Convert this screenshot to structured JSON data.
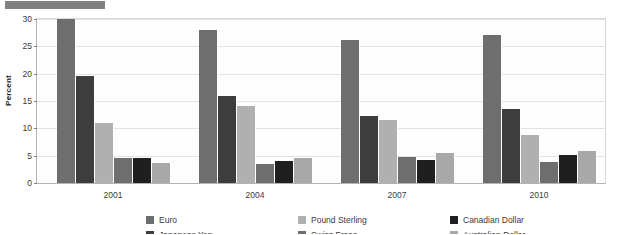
{
  "top_bar": {
    "name": "header-marker-bar",
    "color": "#808080"
  },
  "chart_data": {
    "type": "bar",
    "title": "",
    "subtitle": "",
    "xlabel": "",
    "ylabel": "Percent",
    "ylim": [
      0,
      30
    ],
    "yticks": [
      0,
      5,
      10,
      15,
      20,
      25,
      30
    ],
    "ytick_labels": [
      "0",
      "5",
      "10",
      "15",
      "20",
      "25",
      "30"
    ],
    "grid": true,
    "legend_position": "bottom",
    "categories": [
      "2001",
      "2004",
      "2007",
      "2010"
    ],
    "series": [
      {
        "name": "Euro",
        "color": "#6e6e6e",
        "values": [
          30.0,
          27.9,
          26.2,
          27.1
        ]
      },
      {
        "name": "Japanese Yen",
        "color": "#3d3d3d",
        "values": [
          19.5,
          15.9,
          12.2,
          13.5
        ]
      },
      {
        "name": "Pound Sterling",
        "color": "#b0b0b0",
        "values": [
          11.0,
          14.0,
          11.5,
          8.8
        ]
      },
      {
        "name": "Swiss Franc",
        "color": "#6e6e6e",
        "values": [
          4.6,
          3.5,
          4.7,
          3.9
        ]
      },
      {
        "name": "Canadian Dollar",
        "color": "#1f1f1f",
        "values": [
          4.5,
          4.1,
          4.3,
          5.2
        ]
      },
      {
        "name": "Australian Dollar",
        "color": "#a8a8a8",
        "values": [
          3.6,
          4.5,
          5.4,
          5.9
        ]
      }
    ]
  },
  "colors": {
    "plot_background": "#fdfdfd",
    "gridline": "#e3e3e3",
    "axis": "#b3b3b3",
    "text": "#3a3a3a"
  }
}
